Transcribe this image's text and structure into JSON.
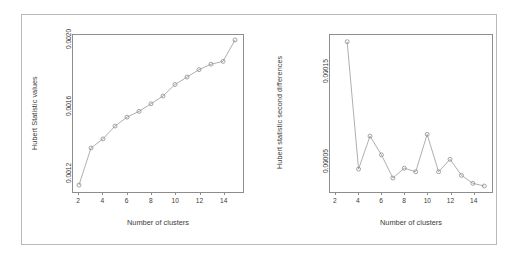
{
  "figure": {
    "background": "#ffffff",
    "frame_color": "#b9b9b9",
    "axis_color": "#8d8d8d",
    "line_color": "#9a9a9a",
    "marker_color": "#8d8d8d",
    "text_color": "#3b3b3b"
  },
  "chart_data": [
    {
      "type": "line",
      "panel": "left",
      "title": "",
      "xlabel": "Number of clusters",
      "ylabel": "Hubert Statistic values",
      "xticks": [
        "2",
        "4",
        "6",
        "8",
        "10",
        "12",
        "14"
      ],
      "xtick_values": [
        2,
        4,
        6,
        8,
        10,
        12,
        14
      ],
      "yticks": [
        "0.0012",
        "0.0016",
        "0.0020"
      ],
      "ytick_values": [
        0.0012,
        0.0016,
        0.002
      ],
      "xlim": [
        1.5,
        15.5
      ],
      "ylim": [
        0.00109,
        0.00203
      ],
      "grid": false,
      "legend": "none",
      "marker": "open-circle",
      "linestyle": "solid",
      "x": [
        2,
        3,
        4,
        5,
        6,
        7,
        8,
        9,
        10,
        11,
        12,
        13,
        14,
        15
      ],
      "values": [
        0.00112,
        0.001345,
        0.0014,
        0.001478,
        0.001532,
        0.001567,
        0.001613,
        0.00166,
        0.00173,
        0.001775,
        0.00182,
        0.001853,
        0.00187,
        0.002
      ]
    },
    {
      "type": "line",
      "panel": "right",
      "title": "",
      "xlabel": "Number of clusters",
      "ylabel": "Hubert statistic second differences",
      "xticks": [
        "2",
        "4",
        "6",
        "8",
        "10",
        "12",
        "14"
      ],
      "xtick_values": [
        2,
        4,
        6,
        8,
        10,
        12,
        14
      ],
      "yticks": [
        "0.00005",
        "0.00015"
      ],
      "ytick_values": [
        5e-05,
        0.00015
      ],
      "xlim": [
        1.5,
        15.5
      ],
      "ylim": [
        1.65e-05,
        0.0001905
      ],
      "grid": false,
      "legend": "none",
      "marker": "open-circle",
      "linestyle": "solid",
      "x": [
        3,
        4,
        5,
        6,
        7,
        8,
        9,
        10,
        11,
        12,
        13,
        14,
        15
      ],
      "values": [
        0.000183,
        4e-05,
        7.7e-05,
        5.6e-05,
        3e-05,
        4.1e-05,
        3.7e-05,
        7.9e-05,
        3.7e-05,
        5.1e-05,
        3.3e-05,
        2.4e-05,
        2.1e-05
      ]
    }
  ]
}
